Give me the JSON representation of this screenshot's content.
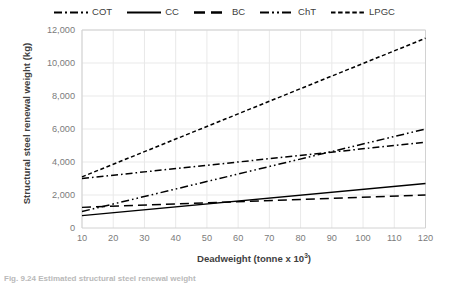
{
  "chart_data": {
    "type": "line",
    "title": "",
    "xlabel": "Deadweight (tonne x 10³)",
    "xlabel_base": "Deadweight (tonne x 10",
    "xlabel_exp": "3",
    "xlabel_tail": ")",
    "ylabel": "Structural steel renewal weight (kg)",
    "xlim": [
      10,
      120
    ],
    "ylim": [
      0,
      12000
    ],
    "xticks": [
      10,
      20,
      30,
      40,
      50,
      60,
      70,
      80,
      90,
      100,
      110,
      120
    ],
    "xtick_labels": [
      "10",
      "20",
      "30",
      "40",
      "50",
      "60",
      "70",
      "80",
      "90",
      "100",
      "110",
      "120"
    ],
    "yticks": [
      0,
      2000,
      4000,
      6000,
      8000,
      10000,
      12000
    ],
    "ytick_labels": [
      "0",
      "2,000",
      "4,000",
      "6,000",
      "8,000",
      "10,000",
      "12,000"
    ],
    "grid": true,
    "legend_position": "top-center",
    "x": [
      10,
      120
    ],
    "series": [
      {
        "name": "COT",
        "label": "COT",
        "dash_style": "dash-dot",
        "dasharray": "7,3,1.6,3",
        "color": "#000000",
        "values": [
          3000,
          5200
        ]
      },
      {
        "name": "CC",
        "label": "CC",
        "dash_style": "solid",
        "dasharray": "",
        "color": "#000000",
        "values": [
          750,
          2700
        ]
      },
      {
        "name": "BC",
        "label": "BC",
        "dash_style": "long-dash",
        "dasharray": "9,5",
        "color": "#000000",
        "values": [
          1250,
          2000
        ]
      },
      {
        "name": "ChT",
        "label": "ChT",
        "dash_style": "dash-dot-dot",
        "dasharray": "8,3,1.6,3,1.6,3",
        "color": "#000000",
        "values": [
          1000,
          6000
        ]
      },
      {
        "name": "LPGC",
        "label": "LPGC",
        "dash_style": "fine-dash",
        "dasharray": "4,2.6",
        "color": "#000000",
        "values": [
          3100,
          11500
        ]
      }
    ]
  },
  "caption": {
    "text": "Fig. 9.24  Estimated structural steel renewal weight"
  }
}
